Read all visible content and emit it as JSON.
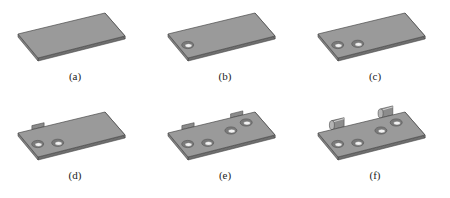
{
  "figure": {
    "panels": [
      {
        "id": "a",
        "label": "(a)",
        "holes": 0,
        "tabs": 0,
        "hinges": 0,
        "description": "plain plate"
      },
      {
        "id": "b",
        "label": "(b)",
        "holes": 1,
        "tabs": 0,
        "hinges": 0,
        "description": "plate with one countersunk hole"
      },
      {
        "id": "c",
        "label": "(c)",
        "holes": 2,
        "tabs": 0,
        "hinges": 0,
        "description": "plate with two countersunk holes"
      },
      {
        "id": "d",
        "label": "(d)",
        "holes": 2,
        "tabs": 1,
        "hinges": 0,
        "description": "plate with two holes and one tab"
      },
      {
        "id": "e",
        "label": "(e)",
        "holes": 4,
        "tabs": 2,
        "hinges": 0,
        "description": "plate with four holes and two tabs"
      },
      {
        "id": "f",
        "label": "(f)",
        "holes": 4,
        "tabs": 2,
        "hinges": 2,
        "description": "plate with four holes and two rolled hinge knuckles"
      }
    ],
    "colors": {
      "top_face": "#9a9a9a",
      "edge": "#4a4a4a",
      "side_face": "#6e6e6e",
      "hole_inner": "#f2f2f2",
      "hole_rim": "#5a5a5a",
      "label": "#222222"
    }
  }
}
